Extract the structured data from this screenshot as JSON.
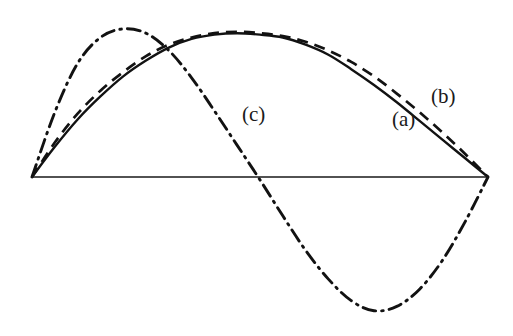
{
  "figure": {
    "background_color": "#ffffff",
    "line_color": "#121212",
    "width": 513,
    "height": 336
  },
  "labels": {
    "a": "(a)",
    "b": "(b)",
    "c": "(c)"
  },
  "chart_data": {
    "type": "line",
    "title": "",
    "subtitle": "",
    "xlabel": "",
    "ylabel": "",
    "grid": false,
    "legend_position": "inline-annotations",
    "axis": {
      "baseline_y_pixel": 177,
      "x_start_pixel": 32,
      "x_end_pixel": 488,
      "x_domain": [
        0,
        1
      ],
      "y_domain": [
        -1.05,
        1.05
      ],
      "baseline_visible": true,
      "axis_ticks": false,
      "tick_labels": []
    },
    "annotations": [
      {
        "text": "(a)",
        "x_pixel": 392,
        "y_pixel": 109,
        "refers_to": "series-a"
      },
      {
        "text": "(b)",
        "x_pixel": 431,
        "y_pixel": 86,
        "refers_to": "series-b"
      },
      {
        "text": "(c)",
        "x_pixel": 242,
        "y_pixel": 104,
        "refers_to": "series-c"
      }
    ],
    "series": [
      {
        "name": "(a)",
        "style": "solid",
        "color": "#121212",
        "description": "smooth single arch above baseline, peak near x=0.50",
        "x": [
          0.0,
          0.05,
          0.1,
          0.15,
          0.2,
          0.25,
          0.3,
          0.35,
          0.4,
          0.45,
          0.5,
          0.55,
          0.6,
          0.65,
          0.7,
          0.75,
          0.8,
          0.85,
          0.9,
          0.95,
          1.0
        ],
        "y": [
          0.0,
          0.21,
          0.4,
          0.56,
          0.7,
          0.81,
          0.9,
          0.96,
          0.99,
          1.0,
          0.99,
          0.97,
          0.92,
          0.85,
          0.75,
          0.64,
          0.52,
          0.39,
          0.26,
          0.13,
          0.0
        ]
      },
      {
        "name": "(b)",
        "style": "dashed",
        "color": "#121212",
        "description": "dashed arch nearly coincident with (a), slightly outside on both flanks",
        "x": [
          0.0,
          0.05,
          0.1,
          0.15,
          0.2,
          0.25,
          0.3,
          0.35,
          0.4,
          0.45,
          0.5,
          0.55,
          0.6,
          0.65,
          0.7,
          0.75,
          0.8,
          0.85,
          0.9,
          0.95,
          1.0
        ],
        "y": [
          0.0,
          0.24,
          0.44,
          0.6,
          0.73,
          0.84,
          0.92,
          0.97,
          1.0,
          1.01,
          1.0,
          0.98,
          0.94,
          0.88,
          0.8,
          0.7,
          0.58,
          0.45,
          0.31,
          0.16,
          0.0
        ]
      },
      {
        "name": "(c)",
        "style": "dash-dot",
        "color": "#121212",
        "description": "full sine wave: positive lobe peaking near x=0.22, crosses baseline near x=0.50, negative lobe trough near x=0.73",
        "x": [
          0.0,
          0.05,
          0.1,
          0.15,
          0.2,
          0.25,
          0.3,
          0.35,
          0.4,
          0.45,
          0.5,
          0.55,
          0.6,
          0.65,
          0.7,
          0.75,
          0.8,
          0.85,
          0.9,
          0.95,
          1.0
        ],
        "y": [
          0.0,
          0.45,
          0.79,
          0.97,
          1.03,
          1.0,
          0.88,
          0.69,
          0.46,
          0.22,
          -0.02,
          -0.27,
          -0.51,
          -0.71,
          -0.86,
          -0.93,
          -0.9,
          -0.78,
          -0.58,
          -0.31,
          0.0
        ]
      }
    ]
  }
}
